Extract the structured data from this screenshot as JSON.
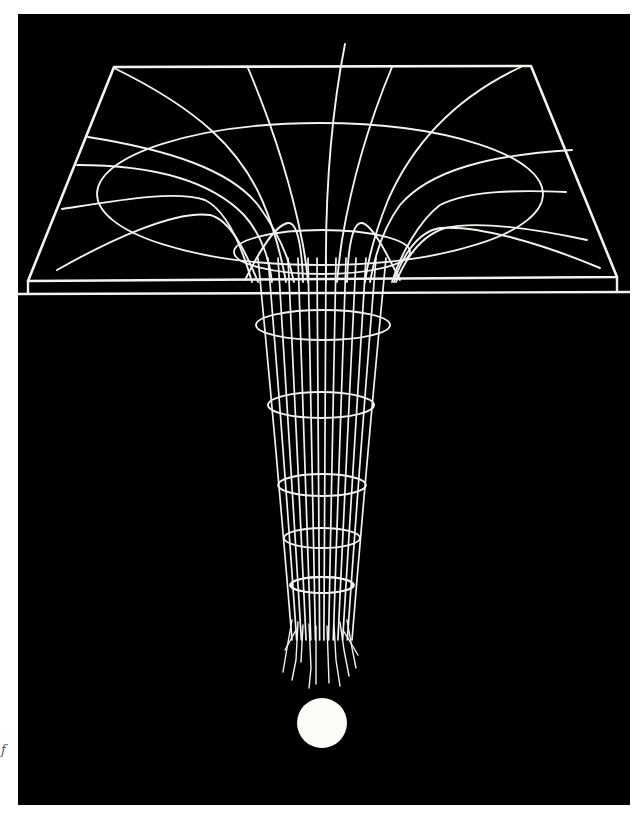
{
  "figure": {
    "background_color": "#ffffff",
    "panel_color": "#000000",
    "wire_color": "#f2f2ee",
    "sphere_color": "#fbfbf8",
    "margin_mark": "f"
  },
  "panel": {
    "x": 18,
    "y": 14,
    "width": 612,
    "height": 791
  },
  "plane": {
    "top_left": [
      114,
      67
    ],
    "top_right": [
      531,
      66
    ],
    "front_left": [
      28,
      281
    ],
    "front_right": [
      617,
      277
    ],
    "slab_bottom_y": 293,
    "slab_line_start_x": 18
  },
  "rim_ellipse": {
    "cx": 320,
    "cy": 194,
    "rx": 223,
    "ry": 71
  },
  "throat_ellipse": {
    "cx": 322,
    "cy": 252,
    "rx": 88,
    "ry": 22
  },
  "funnel_rings": [
    {
      "cx": 323,
      "cy": 325,
      "rx": 67,
      "ry": 15
    },
    {
      "cx": 321,
      "cy": 405,
      "rx": 53,
      "ry": 13
    },
    {
      "cx": 322,
      "cy": 485,
      "rx": 44,
      "ry": 11
    },
    {
      "cx": 322,
      "cy": 538,
      "rx": 38,
      "ry": 10
    },
    {
      "cx": 322,
      "cy": 585,
      "rx": 32,
      "ry": 8
    },
    {
      "cx": 322,
      "cy": 585,
      "rx": 31,
      "ry": 8
    }
  ],
  "sphere": {
    "cx": 322,
    "cy": 723,
    "r": 25
  }
}
